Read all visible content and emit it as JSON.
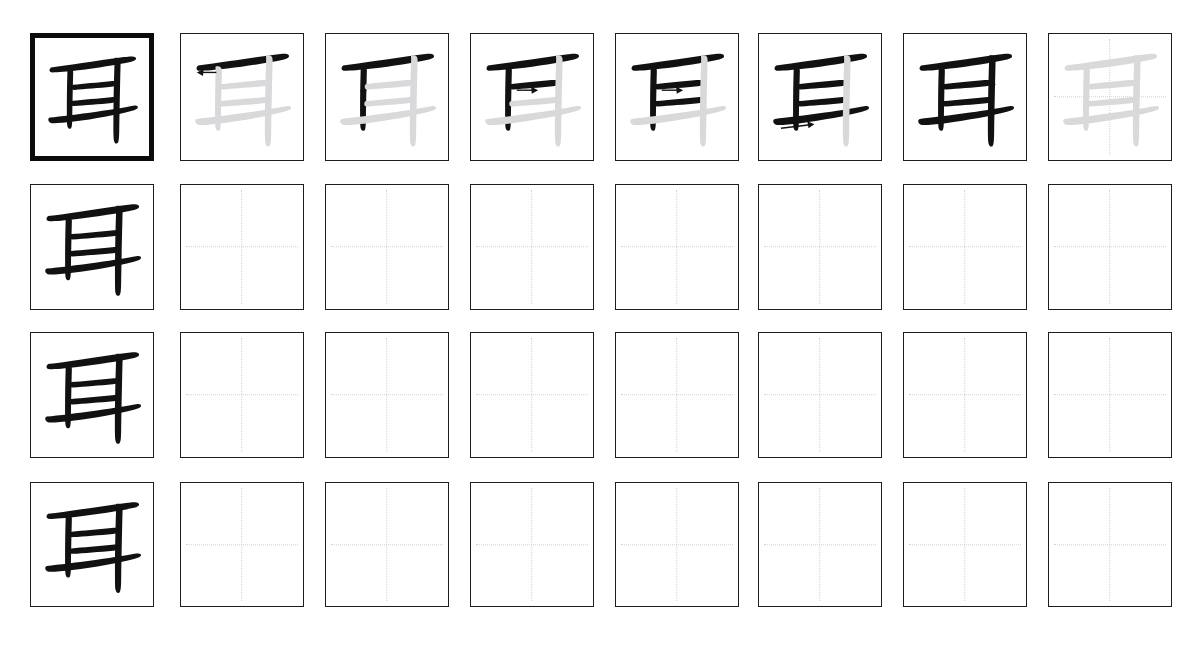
{
  "document": {
    "type": "chinese-character-practice-worksheet",
    "character": "耳",
    "meaning_hint": "ear",
    "total_strokes": 6,
    "header_text": "",
    "background_color": "#ffffff",
    "ink_color": "#111111",
    "ghost_color": "#d9d9dc",
    "guide_color": "#d2d2d4",
    "border_color": "#1d1d1d",
    "emphasis_border_color": "#0b0b0b"
  },
  "grid": {
    "rows": 4,
    "columns": 8,
    "cell_width": 124,
    "cell_height": 128,
    "column_x": [
      30,
      180,
      325,
      470,
      615,
      758,
      903,
      1048
    ],
    "row_y": [
      33,
      184,
      332,
      482
    ],
    "row_height": [
      128,
      126,
      126,
      125
    ]
  },
  "rows": [
    {
      "index": 1,
      "label": "stroke-order-row",
      "cells": [
        {
          "col": 1,
          "kind": "model",
          "strokes_shown": 6,
          "arrow": null,
          "emphasis": true,
          "guides": false,
          "ghost_remaining": false
        },
        {
          "col": 2,
          "kind": "stroke-step",
          "strokes_shown": 1,
          "arrow": "left",
          "emphasis": false,
          "guides": false,
          "ghost_remaining": true
        },
        {
          "col": 3,
          "kind": "stroke-step",
          "strokes_shown": 2,
          "arrow": "down",
          "emphasis": false,
          "guides": false,
          "ghost_remaining": true
        },
        {
          "col": 4,
          "kind": "stroke-step",
          "strokes_shown": 3,
          "arrow": "right",
          "emphasis": false,
          "guides": false,
          "ghost_remaining": true
        },
        {
          "col": 5,
          "kind": "stroke-step",
          "strokes_shown": 4,
          "arrow": "right",
          "emphasis": false,
          "guides": false,
          "ghost_remaining": true
        },
        {
          "col": 6,
          "kind": "stroke-step",
          "strokes_shown": 5,
          "arrow": "right-long",
          "emphasis": false,
          "guides": false,
          "ghost_remaining": true
        },
        {
          "col": 7,
          "kind": "stroke-step",
          "strokes_shown": 6,
          "arrow": "down-right",
          "emphasis": false,
          "guides": false,
          "ghost_remaining": true
        },
        {
          "col": 8,
          "kind": "trace",
          "strokes_shown": 0,
          "arrow": null,
          "emphasis": false,
          "guides": true,
          "ghost_remaining": true
        }
      ]
    },
    {
      "index": 2,
      "label": "practice-row",
      "cells": [
        {
          "col": 1,
          "kind": "model",
          "strokes_shown": 6,
          "arrow": null,
          "emphasis": false,
          "guides": false,
          "ghost_remaining": false
        },
        {
          "col": 2,
          "kind": "blank",
          "strokes_shown": 0,
          "arrow": null,
          "emphasis": false,
          "guides": true,
          "ghost_remaining": false
        },
        {
          "col": 3,
          "kind": "blank",
          "strokes_shown": 0,
          "arrow": null,
          "emphasis": false,
          "guides": true,
          "ghost_remaining": false
        },
        {
          "col": 4,
          "kind": "blank",
          "strokes_shown": 0,
          "arrow": null,
          "emphasis": false,
          "guides": true,
          "ghost_remaining": false
        },
        {
          "col": 5,
          "kind": "blank",
          "strokes_shown": 0,
          "arrow": null,
          "emphasis": false,
          "guides": true,
          "ghost_remaining": false
        },
        {
          "col": 6,
          "kind": "blank",
          "strokes_shown": 0,
          "arrow": null,
          "emphasis": false,
          "guides": true,
          "ghost_remaining": false
        },
        {
          "col": 7,
          "kind": "blank",
          "strokes_shown": 0,
          "arrow": null,
          "emphasis": false,
          "guides": true,
          "ghost_remaining": false
        },
        {
          "col": 8,
          "kind": "blank",
          "strokes_shown": 0,
          "arrow": null,
          "emphasis": false,
          "guides": true,
          "ghost_remaining": false
        }
      ]
    },
    {
      "index": 3,
      "label": "practice-row",
      "cells": [
        {
          "col": 1,
          "kind": "model",
          "strokes_shown": 6,
          "arrow": null,
          "emphasis": false,
          "guides": false,
          "ghost_remaining": false
        },
        {
          "col": 2,
          "kind": "blank",
          "strokes_shown": 0,
          "arrow": null,
          "emphasis": false,
          "guides": true,
          "ghost_remaining": false
        },
        {
          "col": 3,
          "kind": "blank",
          "strokes_shown": 0,
          "arrow": null,
          "emphasis": false,
          "guides": true,
          "ghost_remaining": false
        },
        {
          "col": 4,
          "kind": "blank",
          "strokes_shown": 0,
          "arrow": null,
          "emphasis": false,
          "guides": true,
          "ghost_remaining": false
        },
        {
          "col": 5,
          "kind": "blank",
          "strokes_shown": 0,
          "arrow": null,
          "emphasis": false,
          "guides": true,
          "ghost_remaining": false
        },
        {
          "col": 6,
          "kind": "blank",
          "strokes_shown": 0,
          "arrow": null,
          "emphasis": false,
          "guides": true,
          "ghost_remaining": false
        },
        {
          "col": 7,
          "kind": "blank",
          "strokes_shown": 0,
          "arrow": null,
          "emphasis": false,
          "guides": true,
          "ghost_remaining": false
        },
        {
          "col": 8,
          "kind": "blank",
          "strokes_shown": 0,
          "arrow": null,
          "emphasis": false,
          "guides": true,
          "ghost_remaining": false
        }
      ]
    },
    {
      "index": 4,
      "label": "practice-row",
      "cells": [
        {
          "col": 1,
          "kind": "model",
          "strokes_shown": 6,
          "arrow": null,
          "emphasis": false,
          "guides": false,
          "ghost_remaining": false
        },
        {
          "col": 2,
          "kind": "blank",
          "strokes_shown": 0,
          "arrow": null,
          "emphasis": false,
          "guides": true,
          "ghost_remaining": false
        },
        {
          "col": 3,
          "kind": "blank",
          "strokes_shown": 0,
          "arrow": null,
          "emphasis": false,
          "guides": true,
          "ghost_remaining": false
        },
        {
          "col": 4,
          "kind": "blank",
          "strokes_shown": 0,
          "arrow": null,
          "emphasis": false,
          "guides": true,
          "ghost_remaining": false
        },
        {
          "col": 5,
          "kind": "blank",
          "strokes_shown": 0,
          "arrow": null,
          "emphasis": false,
          "guides": true,
          "ghost_remaining": false
        },
        {
          "col": 6,
          "kind": "blank",
          "strokes_shown": 0,
          "arrow": null,
          "emphasis": false,
          "guides": true,
          "ghost_remaining": false
        },
        {
          "col": 7,
          "kind": "blank",
          "strokes_shown": 0,
          "arrow": null,
          "emphasis": false,
          "guides": true,
          "ghost_remaining": false
        },
        {
          "col": 8,
          "kind": "blank",
          "strokes_shown": 0,
          "arrow": null,
          "emphasis": false,
          "guides": true,
          "ghost_remaining": false
        }
      ]
    }
  ],
  "strokes": [
    {
      "order": 1,
      "name": "heng-top",
      "type": "horizontal",
      "direction": "left"
    },
    {
      "order": 2,
      "name": "shu-left",
      "type": "vertical",
      "direction": "down"
    },
    {
      "order": 3,
      "name": "heng-upper-mid",
      "type": "horizontal",
      "direction": "right"
    },
    {
      "order": 4,
      "name": "heng-lower-mid",
      "type": "horizontal",
      "direction": "right"
    },
    {
      "order": 5,
      "name": "heng-bottom",
      "type": "horizontal-long",
      "direction": "right"
    },
    {
      "order": 6,
      "name": "shu-right",
      "type": "vertical-right",
      "direction": "down"
    }
  ]
}
